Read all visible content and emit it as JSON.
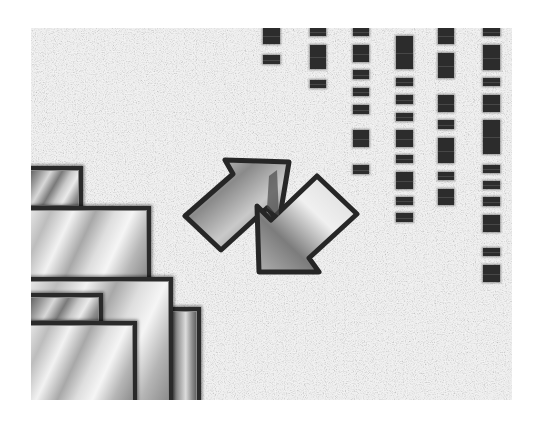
{
  "image": {
    "description": "Abstract grayscale artwork: speckled gray noise field with chrome/metallic rectangles stacked in the lower-left, two interlocking metallic arrows in the center, and columns of dark rectangular dashes in the upper-right",
    "palette": {
      "background": "#ffffff",
      "noise_light": "#d9d9d9",
      "noise_dark": "#6e6e6e",
      "bar_fill": "#2c2c2c",
      "outline": "#2a2a2a",
      "metal_highlight": "#eeeeee",
      "metal_shadow": "#5a5a5a"
    },
    "elements": {
      "noise_field": {
        "x": 31,
        "y": 28,
        "width": 481,
        "height": 372
      },
      "metal_blocks": [
        {
          "name": "block-top-small",
          "x": 31,
          "y": 166,
          "w": 52,
          "h": 44
        },
        {
          "name": "block-wide",
          "x": 31,
          "y": 206,
          "w": 120,
          "h": 76
        },
        {
          "name": "block-large",
          "x": 31,
          "y": 277,
          "w": 142,
          "h": 123
        },
        {
          "name": "block-inner-left",
          "x": 31,
          "y": 293,
          "w": 72,
          "h": 32
        },
        {
          "name": "block-front",
          "x": 31,
          "y": 321,
          "w": 106,
          "h": 79
        },
        {
          "name": "block-right-tall",
          "x": 168,
          "y": 307,
          "w": 33,
          "h": 93
        }
      ],
      "arrows": [
        {
          "name": "arrow-up-right",
          "direction": "north-east"
        },
        {
          "name": "arrow-down-left",
          "direction": "south-west"
        }
      ],
      "dash_columns": [
        {
          "x": 263,
          "w": 17,
          "segments": [
            [
              28,
              16
            ],
            [
              55,
              9
            ]
          ]
        },
        {
          "x": 310,
          "w": 16,
          "segments": [
            [
              28,
              8
            ],
            [
              45,
              24
            ],
            [
              80,
              8
            ]
          ]
        },
        {
          "x": 353,
          "w": 16,
          "segments": [
            [
              28,
              8
            ],
            [
              45,
              17
            ],
            [
              70,
              9
            ],
            [
              88,
              8
            ],
            [
              105,
              9
            ],
            [
              130,
              17
            ],
            [
              165,
              9
            ]
          ]
        },
        {
          "x": 396,
          "w": 17,
          "segments": [
            [
              36,
              33
            ],
            [
              78,
              8
            ],
            [
              95,
              9
            ],
            [
              113,
              8
            ],
            [
              130,
              17
            ],
            [
              155,
              8
            ],
            [
              172,
              17
            ],
            [
              197,
              8
            ],
            [
              213,
              9
            ]
          ]
        },
        {
          "x": 438,
          "w": 16,
          "segments": [
            [
              28,
              16
            ],
            [
              53,
              25
            ],
            [
              95,
              17
            ],
            [
              120,
              9
            ],
            [
              138,
              25
            ],
            [
              172,
              8
            ],
            [
              189,
              16
            ]
          ]
        },
        {
          "x": 483,
          "w": 17,
          "segments": [
            [
              28,
              8
            ],
            [
              45,
              25
            ],
            [
              78,
              8
            ],
            [
              95,
              17
            ],
            [
              120,
              34
            ],
            [
              165,
              8
            ],
            [
              181,
              8
            ],
            [
              197,
              9
            ],
            [
              215,
              17
            ],
            [
              248,
              8
            ],
            [
              265,
              17
            ]
          ]
        }
      ]
    }
  }
}
